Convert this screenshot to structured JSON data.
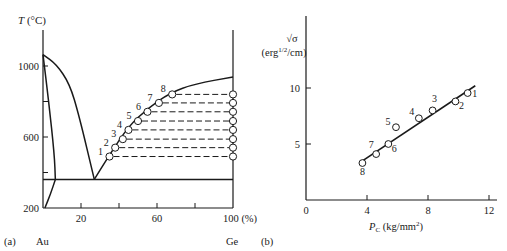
{
  "chart_data": [
    {
      "type": "line",
      "panel_label": "(a)",
      "title": "Au–Ge phase diagram",
      "ylabel": "T (°C)",
      "ylabel_italic": "T",
      "ylabel_unit": " (°C)",
      "xlabel": "100 (%)",
      "x_left_label": "Au",
      "x_right_label": "Ge",
      "xlim": [
        0,
        100
      ],
      "ylim": [
        200,
        1100
      ],
      "x_ticks": [
        0,
        20,
        40,
        60,
        80,
        100
      ],
      "x_tick_labels": [
        {
          "value": 20,
          "label": "20"
        },
        {
          "value": 60,
          "label": "60"
        },
        {
          "value": 100,
          "label": "100 (%)"
        }
      ],
      "y_ticks": [
        200,
        400,
        600,
        800,
        1000
      ],
      "y_tick_labels": [
        {
          "value": 200,
          "label": "200"
        },
        {
          "value": 600,
          "label": "600"
        },
        {
          "value": 1000,
          "label": "1000"
        }
      ],
      "grid": false,
      "series": [
        {
          "name": "Au liquidus",
          "style": "solid",
          "points": [
            [
              0,
              1064
            ],
            [
              7,
              1010
            ],
            [
              14,
              900
            ],
            [
              19,
              720
            ],
            [
              27,
              361
            ]
          ]
        },
        {
          "name": "Au solidus",
          "style": "solid",
          "points": [
            [
              0,
              1064
            ],
            [
              3,
              800
            ],
            [
              6,
              500
            ],
            [
              6.5,
              361
            ]
          ]
        },
        {
          "name": "Au solvus",
          "style": "solid",
          "points": [
            [
              6.5,
              361
            ],
            [
              4,
              280
            ],
            [
              1,
              200
            ]
          ]
        },
        {
          "name": "Eutectic line",
          "style": "solid",
          "points": [
            [
              0,
              361
            ],
            [
              100,
              361
            ]
          ]
        },
        {
          "name": "Ge liquidus",
          "style": "solid",
          "points": [
            [
              27,
              361
            ],
            [
              35,
              500
            ],
            [
              45,
              660
            ],
            [
              55,
              760
            ],
            [
              67,
              850
            ],
            [
              80,
              900
            ],
            [
              100,
              938
            ]
          ]
        },
        {
          "name": "Measured points on liquidus",
          "style": "markers",
          "labels": [
            "1",
            "2",
            "3",
            "4",
            "5",
            "6",
            "7",
            "8"
          ],
          "points": [
            [
              35,
              490
            ],
            [
              38,
              540
            ],
            [
              42,
              588
            ],
            [
              45,
              640
            ],
            [
              50,
              690
            ],
            [
              55,
              742
            ],
            [
              61,
              792
            ],
            [
              68,
              840
            ]
          ]
        },
        {
          "name": "Tie-line end points (pure Ge side)",
          "style": "markers",
          "points": [
            [
              100,
              490
            ],
            [
              100,
              540
            ],
            [
              100,
              588
            ],
            [
              100,
              640
            ],
            [
              100,
              690
            ],
            [
              100,
              742
            ],
            [
              100,
              792
            ],
            [
              100,
              840
            ]
          ]
        }
      ],
      "annotations": [
        "Dashed horizontal tie lines connect points 1–8 to the Ge axis"
      ]
    },
    {
      "type": "scatter",
      "panel_label": "(b)",
      "title": "",
      "ylabel": "√σ (erg^1/2/cm)",
      "ylabel_line1": "√σ",
      "ylabel_line2_pre": "(erg",
      "ylabel_line2_sup": "1/2",
      "ylabel_line2_post": "/cm)",
      "xlabel": "Pc (kg/mm²)",
      "xlabel_italic": "P",
      "xlabel_sub": "C",
      "xlabel_unit_pre": " (kg/mm",
      "xlabel_unit_sup": "2",
      "xlabel_unit_post": ")",
      "xlim": [
        0,
        12.5
      ],
      "ylim": [
        0,
        15
      ],
      "x_ticks": [
        0,
        4,
        8,
        12
      ],
      "x_tick_labels": [
        "0",
        "4",
        "8",
        "12"
      ],
      "y_ticks": [
        5,
        10
      ],
      "y_tick_labels": [
        "5",
        "10"
      ],
      "grid": false,
      "series": [
        {
          "name": "Data points",
          "style": "markers",
          "labels": [
            "1",
            "2",
            "3",
            "4",
            "5",
            "6",
            "7",
            "8"
          ],
          "x": [
            10.6,
            9.8,
            8.3,
            7.4,
            5.9,
            5.4,
            4.6,
            3.7
          ],
          "y": [
            9.55,
            8.8,
            8.0,
            7.3,
            6.5,
            5.0,
            4.1,
            3.3
          ]
        },
        {
          "name": "Linear fit",
          "style": "solid",
          "x": [
            3.6,
            11.1
          ],
          "y": [
            3.4,
            10.2
          ]
        }
      ]
    }
  ]
}
